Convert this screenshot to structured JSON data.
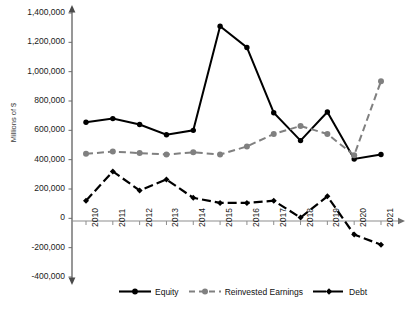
{
  "chart_data": {
    "type": "line",
    "title": "",
    "xlabel": "",
    "ylabel": "Millions of $",
    "categories": [
      "2010",
      "2011",
      "2012",
      "2013",
      "2014",
      "2015",
      "2016",
      "2017",
      "2018",
      "2019",
      "2020",
      "2021"
    ],
    "ylim": [
      -400000,
      1400000
    ],
    "yticks": [
      1400000,
      1200000,
      1000000,
      800000,
      600000,
      400000,
      200000,
      0,
      -200000,
      -400000
    ],
    "ytick_labels": [
      "1,400,000",
      "1,200,000",
      "1,000,000",
      "800,000",
      "600,000",
      "400,000",
      "200,000",
      "0",
      "-200,000",
      "-400,000"
    ],
    "grid": false,
    "legend_position": "bottom",
    "series": [
      {
        "name": "Equity",
        "color": "#000000",
        "style": "solid",
        "marker": "circle",
        "values": [
          655000,
          680000,
          640000,
          570000,
          600000,
          1310000,
          1165000,
          720000,
          530000,
          725000,
          405000,
          435000
        ]
      },
      {
        "name": "Reinvested Earnings",
        "color": "#808080",
        "style": "dashed",
        "marker": "circle",
        "values": [
          440000,
          455000,
          445000,
          435000,
          450000,
          435000,
          490000,
          575000,
          630000,
          575000,
          430000,
          935000
        ]
      },
      {
        "name": "Debt",
        "color": "#000000",
        "style": "dashed",
        "marker": "diamond",
        "values": [
          120000,
          320000,
          190000,
          265000,
          140000,
          105000,
          105000,
          120000,
          5000,
          150000,
          -110000,
          -180000
        ]
      }
    ]
  },
  "legend": {
    "items": [
      {
        "label": "Equity"
      },
      {
        "label": "Reinvested Earnings"
      },
      {
        "label": "Debt"
      }
    ]
  }
}
